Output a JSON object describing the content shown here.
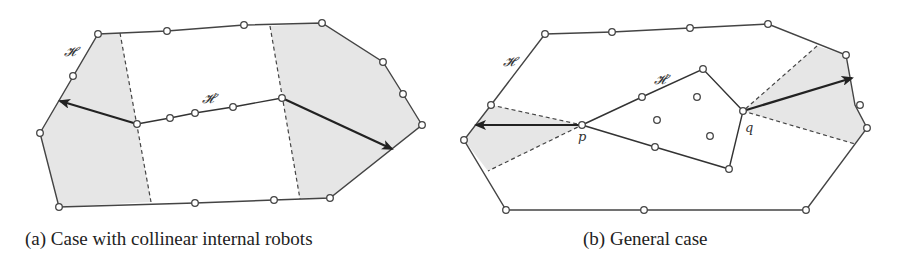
{
  "figure": {
    "panels": [
      {
        "id": "a",
        "caption": "(a) Case with collinear internal robots",
        "labels": {
          "outer_hull": "𝓗",
          "inner_hull": "𝓗′"
        }
      },
      {
        "id": "b",
        "caption": "(b) General case",
        "labels": {
          "outer_hull": "𝓗",
          "inner_hull": "𝓗′",
          "point_p": "p",
          "point_q": "q"
        }
      }
    ]
  }
}
